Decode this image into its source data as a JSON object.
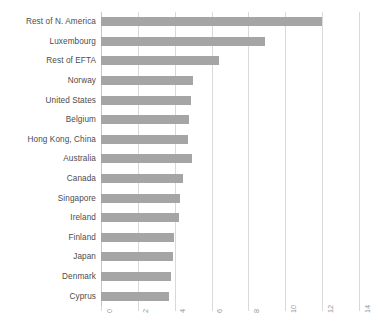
{
  "chart_data": {
    "type": "bar",
    "orientation": "horizontal",
    "title": "",
    "subtitle": "",
    "xlabel": "",
    "ylabel": "",
    "xlim": [
      0,
      14
    ],
    "ylim": null,
    "grid": true,
    "legend": false,
    "legend_position": "none",
    "bar_color": "#a5a5a5",
    "gridline_color": "#d9d9d9",
    "label_color": "#4c4c4c",
    "tick_color": "#9a9a9a",
    "xticks": [
      0,
      2,
      4,
      6,
      8,
      10,
      12,
      14
    ],
    "xtick_labels": [
      "0",
      "2",
      "4",
      "6",
      "8",
      "10",
      "12",
      "14"
    ],
    "xtick_rotation": 90,
    "categories": [
      "Rest of N. America",
      "Luxembourg",
      "Rest of EFTA",
      "Norway",
      "United States",
      "Belgium",
      "Hong Kong, China",
      "Australia",
      "Canada",
      "Singapore",
      "Ireland",
      "Finland",
      "Japan",
      "Denmark",
      "Cyprus"
    ],
    "values": [
      12.0,
      8.9,
      6.4,
      5.0,
      4.9,
      4.8,
      4.7,
      4.95,
      4.45,
      4.3,
      4.25,
      3.95,
      3.9,
      3.8,
      3.7
    ],
    "series": [
      {
        "name": "value",
        "values": [
          12.0,
          8.9,
          6.4,
          5.0,
          4.9,
          4.8,
          4.7,
          4.95,
          4.45,
          4.3,
          4.25,
          3.95,
          3.9,
          3.8,
          3.7
        ]
      }
    ]
  }
}
